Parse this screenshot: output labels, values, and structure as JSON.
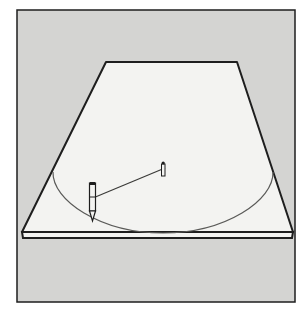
{
  "figure": {
    "description": "Illustration: drawing an ellipse on a board in perspective using a pencil tied by string to a center pin",
    "colors": {
      "page": "#ffffff",
      "backdrop": "#d4d4d2",
      "board": "#f3f3f1",
      "outline": "#1e1e1e",
      "ellipse_line": "#5a5a58",
      "string": "#3a3a38"
    },
    "elements": [
      "backdrop-frame",
      "board",
      "ellipse-arc",
      "center-pin",
      "string",
      "pencil"
    ]
  }
}
